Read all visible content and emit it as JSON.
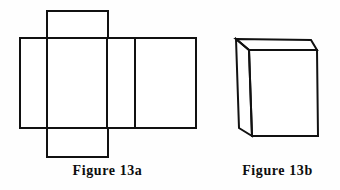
{
  "page": {
    "background_color": "#fefefe",
    "line_color": "#111111",
    "fill_color": "#ffffff",
    "line_width": 2
  },
  "figures": [
    {
      "id": "figure-13a",
      "caption": "Figure 13a",
      "kind": "net-of-rectangular-prism",
      "description": "Unfolded net: horizontal strip of four rectangles with one square flap above and one square flap below the second rectangle",
      "geometry": {
        "band": {
          "x1": 20,
          "y1": 38,
          "x2": 196,
          "y2": 128
        },
        "band_dividers_x": [
          47,
          107,
          135
        ],
        "top_flap": {
          "x1": 47,
          "y1": 11,
          "x2": 108,
          "y2": 38
        },
        "bottom_flap": {
          "x1": 47,
          "y1": 128,
          "x2": 108,
          "y2": 157
        }
      }
    },
    {
      "id": "figure-13b",
      "caption": "Figure 13b",
      "kind": "rectangular-prism-3d",
      "description": "Three dimensional box drawn in oblique projection showing front face, left side face and top face",
      "geometry": {
        "front_face": [
          [
            249,
            50
          ],
          [
            317,
            50
          ],
          [
            318,
            136
          ],
          [
            252,
            136
          ]
        ],
        "left_face": [
          [
            236,
            39
          ],
          [
            249,
            50
          ],
          [
            252,
            136
          ],
          [
            239,
            128
          ]
        ],
        "top_face": [
          [
            236,
            39
          ],
          [
            311,
            40
          ],
          [
            317,
            50
          ],
          [
            249,
            50
          ]
        ]
      }
    }
  ]
}
